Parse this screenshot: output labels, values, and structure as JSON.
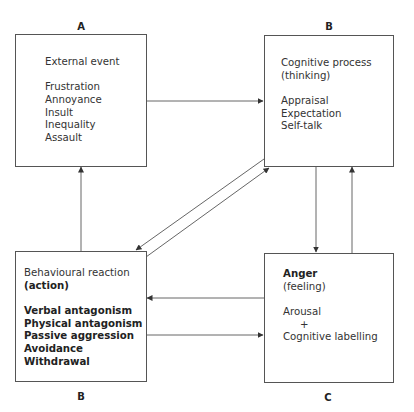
{
  "boxes": {
    "a": {
      "label": "A",
      "title": "External event",
      "items": [
        "Frustration",
        "Annoyance",
        "Insult",
        "Inequality",
        "Assault"
      ]
    },
    "b_top": {
      "label": "B",
      "title": "Cognitive process",
      "subtitle": "(thinking)",
      "items": [
        "Appraisal",
        "Expectation",
        "Self-talk"
      ]
    },
    "b_bottom": {
      "label": "B",
      "title": "Behavioural reaction",
      "subtitle": "(action)",
      "items": [
        "Verbal antagonism",
        "Physical antagonism",
        "Passive aggression",
        "Avoidance",
        "Withdrawal"
      ]
    },
    "c": {
      "label": "C",
      "title": "Anger",
      "subtitle": "(feeling)",
      "items": [
        "Arousal",
        "+",
        "Cognitive labelling"
      ]
    }
  },
  "colors": {
    "line": "#555555",
    "text": "#333333"
  }
}
